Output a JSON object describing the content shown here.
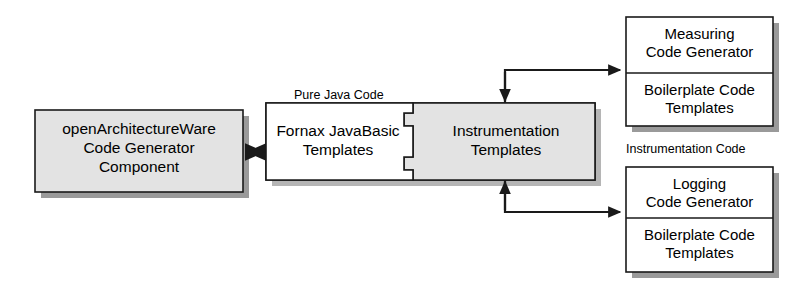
{
  "diagram": {
    "colors": {
      "stroke": "#1a1a1a",
      "shadow": "#9a9a9a",
      "fill_gray": "#e3e3e3",
      "fill_white": "#ffffff",
      "text": "#000000",
      "background": "#ffffff"
    },
    "nodes": {
      "oaw_component": {
        "label": "openArchitectureWare\nCode Generator\nComponent",
        "fill": "gray"
      },
      "pure_java_code_label": {
        "label": "Pure Java Code"
      },
      "fornax_templates": {
        "label": "Fornax JavaBasic\nTemplates",
        "fill": "white"
      },
      "instrumentation_templates": {
        "label": "Instrumentation\nTemplates",
        "fill": "gray"
      },
      "instrumentation_code_label": {
        "label": "Instrumentation Code"
      },
      "measuring_generator": {
        "header": "Measuring\nCode Generator",
        "body": "Boilerplate Code\nTemplates"
      },
      "logging_generator": {
        "header": "Logging\nCode Generator",
        "body": "Boilerplate Code\nTemplates"
      }
    },
    "connectors": [
      {
        "name": "oaw-to-pure-java-code",
        "from": "oaw_component",
        "to": "fornax_templates",
        "style": "double-headed"
      },
      {
        "name": "measuring-to-instrumentation",
        "from": "instrumentation_templates",
        "to": "measuring_generator",
        "style": "single-headed"
      },
      {
        "name": "logging-to-instrumentation",
        "from": "instrumentation_templates",
        "to": "logging_generator",
        "style": "single-headed"
      }
    ]
  }
}
